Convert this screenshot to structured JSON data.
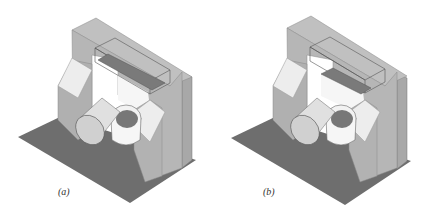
{
  "figure": {
    "panels": [
      {
        "id": "a",
        "caption": "(a)",
        "description": "Isometric view of gantry frame with transparent top beam box, tilted cylinder and ring on gray floor plate"
      },
      {
        "id": "b",
        "caption": "(b)",
        "description": "Isometric view of gantry frame with transparent top beam box (beam moved), tilted cylinder and ring on gray floor plate"
      }
    ]
  },
  "colors": {
    "floor": "#6e6e6e",
    "frame_front": "#b4b4b4",
    "frame_side": "#a2a2a2",
    "frame_top": "#c4c4c4",
    "chamfer_light": "#ececec",
    "box_edge": "#555555",
    "beam": "#7a7a7a",
    "cylinder": "#e2e2e2",
    "ring": "#f4f4f4"
  }
}
